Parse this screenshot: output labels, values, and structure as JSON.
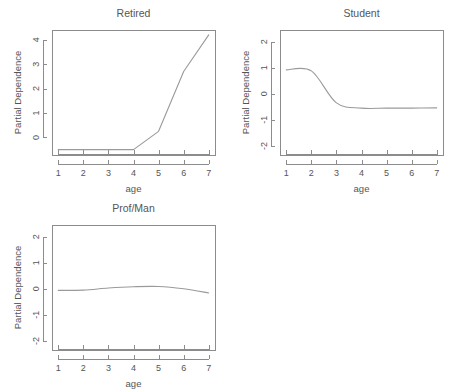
{
  "figure": {
    "background": "#ffffff",
    "line_color": "#9a9a9a",
    "axis_color": "#8c8c8c",
    "text_color": "#555555",
    "layout": "2x2 grid, fourth cell empty"
  },
  "chart_data": [
    {
      "type": "line",
      "title": "Retired",
      "xlabel": "age",
      "ylabel": "Partial Dependence",
      "x": [
        1,
        2,
        3,
        4,
        5,
        6,
        7
      ],
      "values": [
        -0.5,
        -0.5,
        -0.5,
        -0.5,
        0.25,
        2.7,
        4.2
      ],
      "xlim": [
        0.75,
        7.25
      ],
      "ylim": [
        -0.72,
        4.4
      ],
      "xticks": [
        1,
        2,
        3,
        4,
        5,
        6,
        7
      ],
      "xtick_labels": [
        "1",
        "2",
        "3",
        "4",
        "5",
        "6",
        "7"
      ],
      "yticks": [
        0,
        1,
        2,
        3,
        4
      ],
      "ytick_labels": [
        "0",
        "1",
        "2",
        "3",
        "4"
      ],
      "rug": true,
      "grid": false,
      "legend": "none"
    },
    {
      "type": "line",
      "title": "Student",
      "xlabel": "age",
      "ylabel": "Partial Dependence",
      "x": [
        1,
        2,
        3,
        4,
        5,
        6,
        7
      ],
      "values": [
        0.92,
        0.88,
        -0.35,
        -0.55,
        -0.55,
        -0.55,
        -0.54
      ],
      "xlim": [
        0.75,
        7.25
      ],
      "ylim": [
        -2.35,
        2.45
      ],
      "xticks": [
        1,
        2,
        3,
        4,
        5,
        6,
        7
      ],
      "xtick_labels": [
        "1",
        "2",
        "3",
        "4",
        "5",
        "6",
        "7"
      ],
      "yticks": [
        -2,
        -1,
        0,
        1,
        2
      ],
      "ytick_labels": [
        "-2",
        "-1",
        "0",
        "1",
        "2"
      ],
      "rug": true,
      "grid": false,
      "legend": "none"
    },
    {
      "type": "line",
      "title": "Prof/Man",
      "xlabel": "age",
      "ylabel": "Partial Dependence",
      "x": [
        1,
        2,
        3,
        4,
        5,
        6,
        7
      ],
      "values": [
        -0.06,
        -0.05,
        0.03,
        0.08,
        0.09,
        0.0,
        -0.16
      ],
      "xlim": [
        0.75,
        7.25
      ],
      "ylim": [
        -2.35,
        2.45
      ],
      "xticks": [
        1,
        2,
        3,
        4,
        5,
        6,
        7
      ],
      "xtick_labels": [
        "1",
        "2",
        "3",
        "4",
        "5",
        "6",
        "7"
      ],
      "yticks": [
        -2,
        -1,
        0,
        1,
        2
      ],
      "ytick_labels": [
        "-2",
        "-1",
        "0",
        "1",
        "2"
      ],
      "rug": true,
      "grid": false,
      "legend": "none"
    }
  ]
}
